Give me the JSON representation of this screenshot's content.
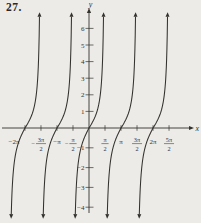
{
  "problem_number": "27.",
  "chart_data": {
    "type": "line",
    "title": "27.",
    "function": "y = tan x",
    "x_axis_label": "x",
    "y_axis_label": "y",
    "grid": false,
    "legend": false,
    "x_ticks": [
      {
        "v_pi": -2,
        "text": "−2π",
        "label_dx": -11
      },
      {
        "v_pi": -1.5,
        "pre": "−",
        "num": "3π",
        "den": "2"
      },
      {
        "v_pi": -1,
        "text": "−π"
      },
      {
        "v_pi": -0.5,
        "pre": "−",
        "num": "π",
        "den": "2"
      },
      {
        "v_pi": 0.5,
        "num": "π",
        "den": "2"
      },
      {
        "v_pi": 1,
        "text": "π"
      },
      {
        "v_pi": 1.5,
        "num": "3π",
        "den": "2"
      },
      {
        "v_pi": 2,
        "text": "2π"
      },
      {
        "v_pi": 2.5,
        "num": "5π",
        "den": "2"
      }
    ],
    "y_ticks": [
      {
        "v": 6,
        "text": "6"
      },
      {
        "v": 5,
        "text": "5"
      },
      {
        "v": 4,
        "text": "4"
      },
      {
        "v": 3,
        "text": "3"
      },
      {
        "v": 2,
        "text": "2"
      },
      {
        "v": 1,
        "text": "1"
      },
      {
        "v": -1,
        "text": "−1"
      },
      {
        "v": -2,
        "text": "−2"
      },
      {
        "v": -3,
        "text": "−3"
      },
      {
        "v": -4,
        "text": "−4"
      }
    ],
    "zero_crossings_pi": [
      -2,
      -1,
      0,
      1,
      2
    ],
    "asymptotes_pi": [
      -2.5,
      -1.5,
      -0.5,
      0.5,
      1.5,
      2.5
    ],
    "y_range_drawn": [
      -4.35,
      6.7
    ],
    "axes_arrows": true,
    "layout": {
      "origin_px": [
        89,
        128
      ],
      "px_per_radian": 10.19,
      "px_per_y_unit_above": 16.6,
      "px_per_y_unit_below": 19.8,
      "x_axis_start_px": 2,
      "x_axis_end_px": 189,
      "y_axis_top_px": 13,
      "y_axis_bottom_px": 213
    },
    "colors": {
      "ink": "#34322e",
      "background": "#edebe7"
    }
  }
}
